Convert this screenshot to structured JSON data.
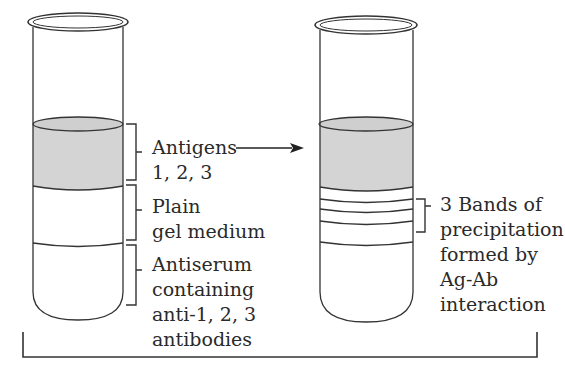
{
  "diagram": {
    "tubes": [
      {
        "id": "before",
        "layers": [
          {
            "name": "Antigens",
            "fill": "#d4d4d4"
          },
          {
            "name": "Plain gel medium",
            "fill": "#ffffff"
          },
          {
            "name": "Antiserum",
            "fill": "#ffffff"
          }
        ]
      },
      {
        "id": "after",
        "bands": 3
      }
    ],
    "labels": {
      "antigens_line1": "Antigens",
      "antigens_line2": "1, 2, 3",
      "plain_line1": "Plain",
      "plain_line2": "gel medium",
      "antiserum_line1": "Antiserum",
      "antiserum_line2": "containing",
      "antiserum_line3": "anti-1, 2, 3",
      "antiserum_line4": "antibodies",
      "bands_line1": "3 Bands of",
      "bands_line2": "precipitation",
      "bands_line3": "formed by",
      "bands_line4": "Ag-Ab",
      "bands_line5": "interaction"
    },
    "colors": {
      "stroke": "#333333",
      "antigen_fill": "#d4d4d4",
      "background": "#ffffff"
    }
  }
}
